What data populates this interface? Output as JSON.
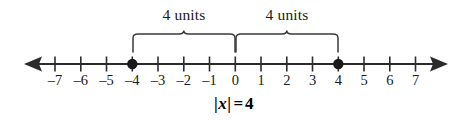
{
  "figure": {
    "kind": "number-line-absolute-value",
    "width": 467,
    "height": 134,
    "background": "#ffffff",
    "ink_color": "#2b2b2b",
    "text_color": "#1a1a1a"
  },
  "number_line": {
    "min_tick": -7,
    "max_tick": 7,
    "axis_y": 64,
    "zero_x": 235,
    "unit_px": 25.75,
    "tick_labels": [
      "–7",
      "–6",
      "–5",
      "–4",
      "–3",
      "–2",
      "–1",
      "0",
      "1",
      "2",
      "3",
      "4",
      "5",
      "6",
      "7"
    ],
    "tick_values": [
      -7,
      -6,
      -5,
      -4,
      -3,
      -2,
      -1,
      0,
      1,
      2,
      3,
      4,
      5,
      6,
      7
    ],
    "arrow_left": true,
    "arrow_right": true
  },
  "points": [
    {
      "label": "–4",
      "value": -4
    },
    {
      "label": "4",
      "value": 4
    }
  ],
  "braces": [
    {
      "label": "4 units",
      "from": -4,
      "to": 0
    },
    {
      "label": "4 units",
      "from": 0,
      "to": 4
    }
  ],
  "equation": {
    "open_bar": "|",
    "variable": "x",
    "close_bar": "|",
    "relation": "=",
    "value": "4",
    "full_text": "|x| = 4"
  }
}
